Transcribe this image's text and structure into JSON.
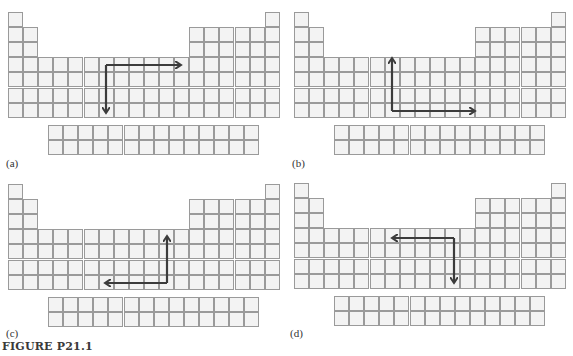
{
  "figure": {
    "caption": "FIGURE P21.1",
    "colors": {
      "cell_fill": "#f3f3f3",
      "cell_border": "#9a9a9a",
      "arrow": "#3c3c3c"
    },
    "grid": {
      "main_columns": 18,
      "main_rows": 7,
      "f_block_columns": 14,
      "f_block_rows": 2,
      "column_heights_desc": "col1: rows1-7; col2: rows2-7; cols3-12: rows4-7; cols13-17: rows2-7; col18: rows1-7"
    },
    "panels": [
      {
        "id": "a",
        "label": "(a)",
        "origin": [
          8,
          12
        ],
        "arrow": {
          "description": "From a d-block cell, one arrow goes right across the period, the other goes down the group",
          "corner": [
            106,
            65
          ],
          "ends": [
            [
              181,
              65
            ],
            [
              106,
              113
            ]
          ]
        }
      },
      {
        "id": "b",
        "label": "(b)",
        "origin": [
          294,
          12
        ],
        "arrow": {
          "description": "From a lower cell, one arrow goes up the group, the other goes right across the period",
          "corner": [
            392,
            111
          ],
          "ends": [
            [
              392,
              58
            ],
            [
              475,
              111
            ]
          ]
        }
      },
      {
        "id": "c",
        "label": "(c)",
        "origin": [
          8,
          184
        ],
        "arrow": {
          "description": "From a lower cell, one arrow goes up the group, the other goes left across the period",
          "corner": [
            167,
            283
          ],
          "ends": [
            [
              167,
              236
            ],
            [
              105,
              283
            ]
          ]
        }
      },
      {
        "id": "d",
        "label": "(d)",
        "origin": [
          294,
          183
        ],
        "arrow": {
          "description": "From an upper cell, one arrow goes left across the period, the other goes down the group",
          "corner": [
            454,
            238
          ],
          "ends": [
            [
              392,
              238
            ],
            [
              454,
              283
            ]
          ]
        }
      }
    ]
  }
}
